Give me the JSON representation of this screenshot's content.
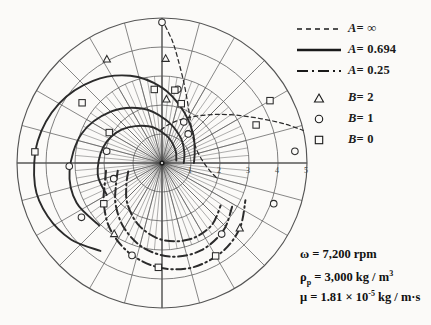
{
  "legend": {
    "lines": [
      {
        "style": "fine-dashed",
        "label_prefix": "A",
        "label_value": "= ∞",
        "name": "legend-line-a-infinity"
      },
      {
        "style": "solid",
        "label_prefix": "A",
        "label_value": "= 0.694",
        "name": "legend-line-a-0694"
      },
      {
        "style": "dash-dot",
        "label_prefix": "A",
        "label_value": "= 0.25",
        "name": "legend-line-a-025"
      }
    ],
    "markers": [
      {
        "shape": "triangle",
        "label_prefix": "B",
        "label_value": "= 2",
        "name": "legend-marker-b-2"
      },
      {
        "shape": "circle",
        "label_prefix": "B",
        "label_value": "= 1",
        "name": "legend-marker-b-1"
      },
      {
        "shape": "square",
        "label_prefix": "B",
        "label_value": "= 0",
        "name": "legend-marker-b-0"
      }
    ]
  },
  "parameters": {
    "omega": {
      "symbol": "ω",
      "text": "= 7,200 rpm"
    },
    "rho": {
      "symbol": "ρ",
      "subscript": "p",
      "text": "= 3,000 kg / m",
      "superscript": "3"
    },
    "mu": {
      "symbol": "μ",
      "text_a": "= 1.81 × 10",
      "superscript": "-5",
      "text_b": " kg / m·s"
    }
  },
  "chart_data": {
    "type": "line",
    "plot_kind": "polar",
    "title": "",
    "xlabel": "",
    "ylabel": "",
    "grid": true,
    "legend_position": "right",
    "axis": {
      "radial_ticks": [
        1,
        2,
        3,
        4,
        5
      ],
      "radial_tick_labels": [
        "1",
        "2",
        "3",
        "4",
        "5"
      ],
      "rlim": [
        0,
        5
      ],
      "angular_major_step_deg": 15,
      "angular_minor_step_deg": 5,
      "theta_units": "degrees",
      "center_px": [
        162,
        163
      ],
      "outer_radius_px": 145
    },
    "series": [
      {
        "name": "A = ∞",
        "line_style": "fine-dashed",
        "A": "∞",
        "points_polar_deg_r": [
          [
            90,
            4.95
          ],
          [
            85,
            4.2
          ],
          [
            80,
            3.45
          ],
          [
            74,
            2.8
          ],
          [
            66,
            2.2
          ],
          [
            56,
            1.75
          ],
          [
            44,
            1.45
          ],
          [
            30,
            1.3
          ],
          [
            14,
            1.3
          ],
          [
            0,
            1.45
          ],
          [
            -10,
            1.7
          ],
          [
            -16,
            2.0
          ]
        ],
        "branch2_polar_deg_r": [
          [
            92,
            1.15
          ],
          [
            88,
            1.2
          ],
          [
            80,
            1.35
          ],
          [
            68,
            1.6
          ],
          [
            54,
            2.0
          ],
          [
            42,
            2.5
          ],
          [
            32,
            3.1
          ],
          [
            24,
            3.75
          ],
          [
            18,
            4.4
          ],
          [
            13,
            5.0
          ]
        ],
        "markers": [
          {
            "shape": "triangle",
            "B": 2,
            "theta_deg": 88,
            "r": 3.6
          },
          {
            "shape": "circle",
            "B": 1,
            "theta_deg": 90,
            "r": 4.85
          },
          {
            "shape": "circle",
            "B": 1,
            "theta_deg": 78,
            "r": 2.6
          },
          {
            "shape": "square",
            "B": 0,
            "theta_deg": 30,
            "r": 4.3
          },
          {
            "shape": "square",
            "B": 0,
            "theta_deg": 22,
            "r": 3.5
          },
          {
            "shape": "circle",
            "B": 1,
            "theta_deg": 5,
            "r": 4.6
          },
          {
            "shape": "circle",
            "B": 1,
            "theta_deg": -20,
            "r": 4.1
          }
        ]
      },
      {
        "name": "A = 0.694",
        "line_style": "solid",
        "A": 0.694,
        "points_polar_deg_r": [
          [
            0,
            1.1
          ],
          [
            20,
            1.2
          ],
          [
            45,
            1.5
          ],
          [
            70,
            2.0
          ],
          [
            90,
            2.6
          ],
          [
            110,
            3.2
          ],
          [
            130,
            3.7
          ],
          [
            150,
            4.1
          ],
          [
            170,
            4.35
          ],
          [
            190,
            4.45
          ],
          [
            205,
            4.35
          ],
          [
            220,
            4.1
          ],
          [
            235,
            3.7
          ]
        ],
        "branch2_polar_deg_r": [
          [
            0,
            0.75
          ],
          [
            25,
            0.85
          ],
          [
            55,
            1.1
          ],
          [
            85,
            1.5
          ],
          [
            110,
            2.0
          ],
          [
            135,
            2.5
          ],
          [
            160,
            2.95
          ],
          [
            185,
            3.2
          ],
          [
            205,
            3.25
          ],
          [
            225,
            3.05
          ]
        ],
        "branch3_polar_deg_r": [
          [
            10,
            0.5
          ],
          [
            45,
            0.65
          ],
          [
            80,
            0.95
          ],
          [
            110,
            1.35
          ],
          [
            140,
            1.8
          ],
          [
            165,
            2.1
          ],
          [
            190,
            2.25
          ],
          [
            210,
            2.2
          ]
        ],
        "markers": [
          {
            "shape": "triangle",
            "B": 2,
            "theta_deg": 118,
            "r": 4.05
          },
          {
            "shape": "square",
            "B": 0,
            "theta_deg": 143,
            "r": 3.45
          },
          {
            "shape": "square",
            "B": 0,
            "theta_deg": 175,
            "r": 4.4
          },
          {
            "shape": "circle",
            "B": 1,
            "theta_deg": 182,
            "r": 3.2
          },
          {
            "shape": "circle",
            "B": 1,
            "theta_deg": 214,
            "r": 3.35
          },
          {
            "shape": "square",
            "B": 0,
            "theta_deg": 150,
            "r": 2.1
          },
          {
            "shape": "circle",
            "B": 1,
            "theta_deg": 168,
            "r": 1.95
          },
          {
            "shape": "square",
            "B": 0,
            "theta_deg": 96,
            "r": 2.55
          },
          {
            "shape": "square",
            "B": 0,
            "theta_deg": 80,
            "r": 2.55
          },
          {
            "shape": "square",
            "B": 0,
            "theta_deg": 72,
            "r": 2.15
          },
          {
            "shape": "triangle",
            "B": 2,
            "theta_deg": 86,
            "r": 2.2
          },
          {
            "shape": "circle",
            "B": 1,
            "theta_deg": 62,
            "r": 1.6
          },
          {
            "shape": "circle",
            "B": 1,
            "theta_deg": 48,
            "r": 1.35
          }
        ]
      },
      {
        "name": "A = 0.25",
        "line_style": "dash-dot",
        "A": 0.25,
        "points_polar_deg_r": [
          [
            188,
            1.95
          ],
          [
            200,
            2.1
          ],
          [
            215,
            2.45
          ],
          [
            232,
            2.9
          ],
          [
            250,
            3.3
          ],
          [
            268,
            3.6
          ],
          [
            286,
            3.75
          ],
          [
            304,
            3.7
          ],
          [
            320,
            3.5
          ],
          [
            336,
            3.15
          ]
        ],
        "branch2_polar_deg_r": [
          [
            190,
            1.55
          ],
          [
            205,
            1.75
          ],
          [
            222,
            2.15
          ],
          [
            240,
            2.6
          ],
          [
            258,
            3.0
          ],
          [
            276,
            3.25
          ],
          [
            294,
            3.3
          ],
          [
            312,
            3.15
          ],
          [
            328,
            2.85
          ]
        ],
        "branch3_polar_deg_r": [
          [
            194,
            1.2
          ],
          [
            212,
            1.45
          ],
          [
            230,
            1.85
          ],
          [
            250,
            2.3
          ],
          [
            270,
            2.65
          ],
          [
            290,
            2.8
          ],
          [
            308,
            2.75
          ],
          [
            324,
            2.5
          ]
        ],
        "markers": [
          {
            "shape": "circle",
            "B": 1,
            "theta_deg": 252,
            "r": 3.35
          },
          {
            "shape": "square",
            "B": 0,
            "theta_deg": 268,
            "r": 3.6
          },
          {
            "shape": "triangle",
            "B": 2,
            "theta_deg": 236,
            "r": 2.95
          },
          {
            "shape": "square",
            "B": 0,
            "theta_deg": 300,
            "r": 3.7
          },
          {
            "shape": "circle",
            "B": 1,
            "theta_deg": 310,
            "r": 3.2
          },
          {
            "shape": "triangle",
            "B": 2,
            "theta_deg": 320,
            "r": 3.5
          },
          {
            "shape": "square",
            "B": 0,
            "theta_deg": 215,
            "r": 2.45
          },
          {
            "shape": "circle",
            "B": 1,
            "theta_deg": 198,
            "r": 1.75
          }
        ]
      }
    ]
  }
}
